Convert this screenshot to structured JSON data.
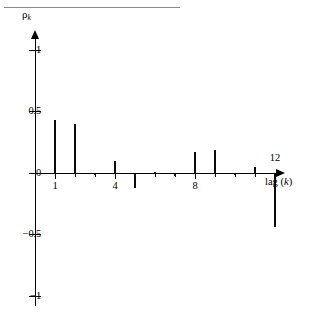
{
  "figure": {
    "top_rule": "",
    "y_axis_title": "ρ",
    "y_axis_title_sub": "k",
    "x_axis_title_prefix": "lag (",
    "x_axis_title_var": "k",
    "x_axis_title_suffix": ")"
  },
  "chart_data": {
    "type": "bar",
    "title": "",
    "subtitle": "",
    "xlabel": "lag (k)",
    "ylabel": "ρk",
    "categories": [
      1,
      2,
      3,
      4,
      5,
      6,
      7,
      8,
      9,
      10,
      11,
      12
    ],
    "values": [
      0.43,
      0.4,
      -0.01,
      0.1,
      -0.12,
      0.01,
      -0.02,
      0.17,
      0.19,
      -0.01,
      0.05,
      -0.44
    ],
    "xlim": [
      0,
      13.3
    ],
    "ylim": [
      -1,
      1
    ],
    "x_tick_values": [
      1,
      4,
      8,
      12
    ],
    "x_tick_labels": [
      "1",
      "4",
      "8",
      "12"
    ],
    "x_minor_ticks": [
      2,
      3,
      5,
      6,
      7,
      9,
      10,
      11
    ],
    "y_ticks": [
      1,
      0.5,
      0,
      -0.5,
      -1
    ],
    "y_tick_labels": [
      "1",
      "0.5",
      "0",
      "−0.5",
      "−1"
    ],
    "grid": false,
    "legend": false,
    "legend_position": "none",
    "bar_color": "#0a0a0a",
    "axis_color": "#000000",
    "background_color": "#ffffff"
  }
}
